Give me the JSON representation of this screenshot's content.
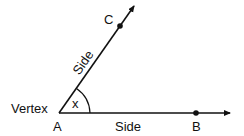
{
  "diagram": {
    "title": "",
    "points": {
      "vertex": {
        "label": "A",
        "x": 59,
        "y": 113
      },
      "point_b": {
        "label": "B",
        "x": 196,
        "y": 113
      },
      "point_c": {
        "label": "C",
        "x": 120,
        "y": 26
      }
    },
    "labels": {
      "vertex_label": "Vertex",
      "side_upper": "Side",
      "side_lower": "Side",
      "angle_label": "x",
      "a": "A",
      "b": "B",
      "c": "C"
    },
    "colors": {
      "stroke": "#111111",
      "background": "#ffffff"
    }
  }
}
